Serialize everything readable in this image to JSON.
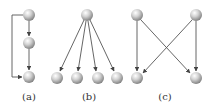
{
  "diagram": {
    "node_radius": 6,
    "colors": {
      "edge": "#555555",
      "node_light": "#f4f4f4",
      "node_dark": "#8a8a8a",
      "label": "#333333"
    },
    "panels": [
      {
        "label": "(a)",
        "label_pos": [
          29,
          100
        ],
        "nodes": [
          [
            29,
            15
          ],
          [
            29,
            43
          ],
          [
            29,
            77
          ]
        ],
        "edges": [
          {
            "path": "M29,21 L29,36"
          },
          {
            "path": "M29,49 L29,70"
          },
          {
            "path": "M23,15 L12,15 L12,77 L22,77"
          }
        ]
      },
      {
        "label": "(b)",
        "label_pos": [
          89,
          100
        ],
        "nodes": [
          [
            87,
            15
          ],
          [
            57,
            78
          ],
          [
            77,
            78
          ],
          [
            98,
            78
          ],
          [
            117,
            78
          ]
        ],
        "edges": [
          {
            "path": "M84,20 L60,71"
          },
          {
            "path": "M86,21 L78,71"
          },
          {
            "path": "M88,21 L96,71"
          },
          {
            "path": "M90,20 L114,71"
          }
        ]
      },
      {
        "label": "(c)",
        "label_pos": [
          165,
          100
        ],
        "nodes": [
          [
            137,
            15
          ],
          [
            196,
            15
          ],
          [
            137,
            78
          ],
          [
            196,
            78
          ]
        ],
        "edges": [
          {
            "path": "M137,21 L137,71"
          },
          {
            "path": "M196,21 L196,71"
          },
          {
            "path": "M141,20 L190,73"
          },
          {
            "path": "M192,20 L143,73"
          }
        ]
      }
    ]
  }
}
